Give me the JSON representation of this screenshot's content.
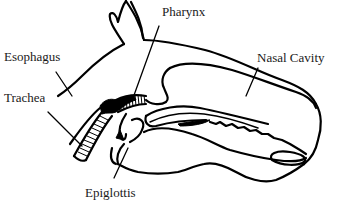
{
  "diagram": {
    "line_color": "#000000",
    "background_color": "#ffffff",
    "labels": [
      {
        "id": "pharynx",
        "text": "Pharynx",
        "x": 162,
        "y": 5
      },
      {
        "id": "esophagus",
        "text": "Esophagus",
        "x": 4,
        "y": 50
      },
      {
        "id": "trachea",
        "text": "Trachea",
        "x": 4,
        "y": 91
      },
      {
        "id": "nasal-cavity",
        "text": "Nasal Cavity",
        "x": 257,
        "y": 51
      },
      {
        "id": "epiglottis",
        "text": "Epiglottis",
        "x": 85,
        "y": 186
      }
    ]
  }
}
